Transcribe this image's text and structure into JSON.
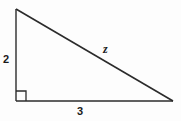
{
  "figure": {
    "type": "right-triangle-diagram",
    "background_color": "#fdfdfd",
    "stroke_color": "#2b2b2b",
    "label_color": "#1a1a1a",
    "labels": {
      "vertical_leg": "2",
      "horizontal_leg": "3",
      "hypotenuse": "z"
    },
    "geometry": {
      "top_vertex": [
        16,
        9
      ],
      "right_angle_vertex": [
        16,
        101
      ],
      "right_vertex": [
        173,
        101
      ],
      "right_angle_marker_size": 10,
      "right_angle_at": "bottom-left"
    }
  }
}
